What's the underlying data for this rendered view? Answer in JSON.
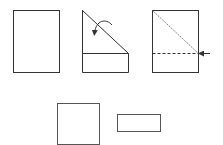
{
  "diagram": {
    "title": "",
    "stroke_color": "#333333",
    "background": "#ffffff",
    "steps": [
      {
        "id": "step-1",
        "shape": "rectangle",
        "x": 13,
        "y": 10,
        "w": 46,
        "h": 62
      },
      {
        "id": "step-2",
        "shape": "folded-rectangle",
        "x": 82,
        "y": 10,
        "w": 46,
        "h": 62,
        "fold_y": 53,
        "arrow": "curved-fold-arrow"
      },
      {
        "id": "step-3",
        "shape": "rectangle-with-fold-lines",
        "x": 152,
        "y": 10,
        "w": 46,
        "h": 62,
        "fold_y": 53,
        "arrow": "cut-arrow"
      }
    ],
    "results": [
      {
        "id": "square",
        "x": 57,
        "y": 103,
        "w": 42,
        "h": 41
      },
      {
        "id": "strip",
        "x": 117,
        "y": 114,
        "w": 43,
        "h": 17
      }
    ]
  }
}
